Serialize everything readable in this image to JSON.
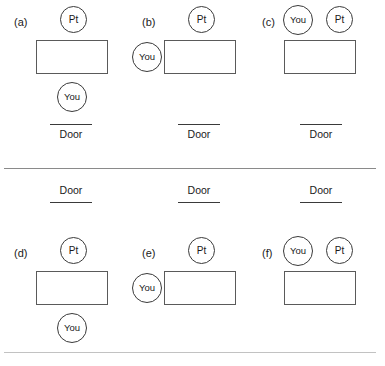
{
  "figure": {
    "caption_labels": [
      "(a)",
      "(b)",
      "(c)",
      "(d)",
      "(e)",
      "(f)"
    ],
    "door_label": "Door",
    "patient_label": "Pt",
    "you_label": "You"
  },
  "panels": [
    {
      "id": "a",
      "label": "(a)",
      "door_label": "Door",
      "door_position": "bottom",
      "pt_label": "Pt",
      "pt_position": "above-room",
      "you_label": "You",
      "you_position": "below-room"
    },
    {
      "id": "b",
      "label": "(b)",
      "door_label": "Door",
      "door_position": "bottom",
      "pt_label": "Pt",
      "pt_position": "above-room",
      "you_label": "You",
      "you_position": "left-of-room"
    },
    {
      "id": "c",
      "label": "(c)",
      "door_label": "Door",
      "door_position": "bottom",
      "pt_label": "Pt",
      "pt_position": "above-room-right",
      "you_label": "You",
      "you_position": "above-room-left"
    },
    {
      "id": "d",
      "label": "(d)",
      "door_label": "Door",
      "door_position": "top",
      "pt_label": "Pt",
      "pt_position": "above-room",
      "you_label": "You",
      "you_position": "below-room"
    },
    {
      "id": "e",
      "label": "(e)",
      "door_label": "Door",
      "door_position": "top",
      "pt_label": "Pt",
      "pt_position": "above-room",
      "you_label": "You",
      "you_position": "left-of-room"
    },
    {
      "id": "f",
      "label": "(f)",
      "door_label": "Door",
      "door_position": "top",
      "pt_label": "Pt",
      "pt_position": "above-room-right",
      "you_label": "You",
      "you_position": "above-room-left"
    }
  ],
  "colors": {
    "stroke": "#3a3a3a",
    "room_stroke": "#5a5a5a",
    "divider": "#8a8a8a",
    "bottom_rule": "#c2c2c2",
    "background": "#ffffff"
  }
}
